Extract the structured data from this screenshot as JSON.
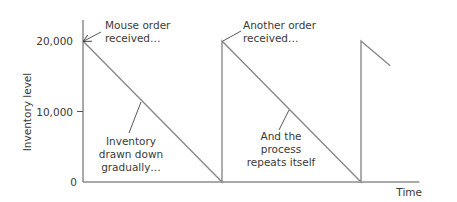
{
  "chart_data": {
    "type": "line",
    "title": "",
    "xlabel": "Time",
    "ylabel": "Inventory level",
    "ylim": [
      0,
      20000
    ],
    "xlim": [
      0,
      2.42
    ],
    "grid": false,
    "yticks": [
      {
        "value": 0,
        "label": "0"
      },
      {
        "value": 10000,
        "label": "10,000"
      },
      {
        "value": 20000,
        "label": "20,000"
      }
    ],
    "series": [
      {
        "name": "Inventory level",
        "color": "#8a8a8a",
        "x": [
          0,
          1,
          1,
          2,
          2,
          2.21
        ],
        "y": [
          20000,
          0,
          20000,
          0,
          20000,
          16500
        ]
      }
    ],
    "annotations": [
      {
        "id": "mouse-order",
        "lines": [
          "Mouse order",
          "received…"
        ],
        "target": [
          0,
          20000
        ],
        "arrow": true
      },
      {
        "id": "another-order",
        "lines": [
          "Another order",
          "received…"
        ],
        "target": [
          1,
          20000
        ],
        "arrow": false
      },
      {
        "id": "drawn-down",
        "lines": [
          "Inventory",
          "drawn down",
          "gradually…"
        ],
        "target": [
          0.42,
          11600
        ],
        "arrow": false
      },
      {
        "id": "repeats",
        "lines": [
          "And the",
          "process",
          "repeats itself"
        ],
        "target": [
          1.48,
          10400
        ],
        "arrow": false
      }
    ]
  }
}
